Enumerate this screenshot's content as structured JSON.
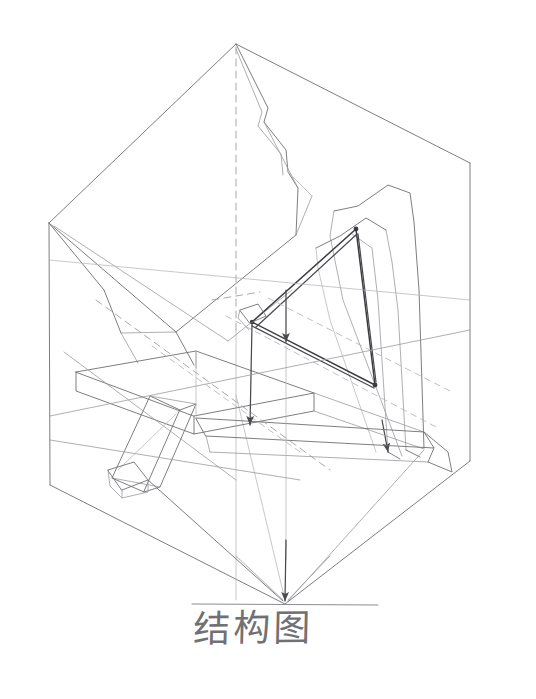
{
  "document": {
    "type": "hand-drawn pencil structural drawing",
    "medium": "pencil on white paper",
    "background_color": "#ffffff",
    "stroke_color": "#6f6f73",
    "dark_stroke_color": "#3c3c41",
    "dashed_stroke_color": "#9a9a9f"
  },
  "caption": {
    "text": "结构图",
    "translation_hint": "structure diagram",
    "color": "#5d5d62"
  },
  "ground_line": {
    "label": "ground-reference-line",
    "color": "#8d8d92",
    "x1": 192,
    "y1": 604,
    "x2": 378,
    "y2": 605
  },
  "figure": {
    "title": "结构图",
    "projection": "axonometric",
    "elements": [
      {
        "name": "bounding-box",
        "description": "transparent rectangular enclosure shown in light construction lines"
      },
      {
        "name": "apex-vertex",
        "description": "upper convergence point of projection lines"
      },
      {
        "name": "roof-plane",
        "description": "upper sloped triangular facets"
      },
      {
        "name": "left-column",
        "description": "vertical left-hand edge member"
      },
      {
        "name": "right-column",
        "description": "vertical right-hand edge member"
      },
      {
        "name": "horizontal-beam",
        "description": "long horizontal beam crossing the lower middle"
      },
      {
        "name": "diagonal-strut",
        "description": "inclined strut descending to the lower left"
      },
      {
        "name": "center-truss-triangle",
        "description": "dark triangular bracing element at the center"
      },
      {
        "name": "base-plate",
        "description": "flat slab at the bottom right of the frame"
      },
      {
        "name": "tapered-post-pair",
        "description": "pair of slender tapered posts rising from the base plate"
      },
      {
        "name": "projection-lines",
        "description": "dashed construction and projection lines with arrowheads"
      },
      {
        "name": "ground-line",
        "description": "horizontal reference line above the caption"
      }
    ]
  }
}
